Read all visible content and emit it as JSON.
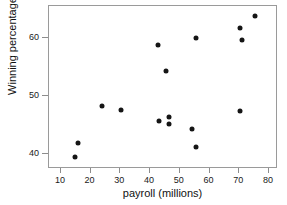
{
  "chart_data": {
    "type": "scatter",
    "title": "",
    "xlabel": "payroll (millions)",
    "ylabel": "Winning percentage",
    "xlim": [
      6,
      83
    ],
    "ylim": [
      37.5,
      65.5
    ],
    "xticks": [
      10,
      20,
      30,
      40,
      50,
      60,
      70,
      80
    ],
    "xticklabels": [
      "10",
      "20",
      "30",
      "40",
      "50",
      "60",
      "70",
      "80"
    ],
    "yticks": [
      40,
      50,
      60
    ],
    "yticklabels": [
      "40",
      "50",
      "60"
    ],
    "grid": false,
    "legend": false,
    "marker": "filled-circle",
    "marker_color": "#151515",
    "points": [
      {
        "x": 14.6,
        "y": 39.6
      },
      {
        "x": 15.6,
        "y": 41.9
      },
      {
        "x": 23.7,
        "y": 48.3
      },
      {
        "x": 30.3,
        "y": 47.6
      },
      {
        "x": 42.5,
        "y": 58.8
      },
      {
        "x": 43.1,
        "y": 45.8
      },
      {
        "x": 45.2,
        "y": 54.3
      },
      {
        "x": 46.2,
        "y": 46.4
      },
      {
        "x": 46.2,
        "y": 45.3
      },
      {
        "x": 54.2,
        "y": 44.3
      },
      {
        "x": 55.4,
        "y": 41.2
      },
      {
        "x": 55.5,
        "y": 60.0
      },
      {
        "x": 70.1,
        "y": 61.8
      },
      {
        "x": 70.1,
        "y": 47.4
      },
      {
        "x": 71.0,
        "y": 59.7
      },
      {
        "x": 75.1,
        "y": 63.8
      }
    ]
  }
}
